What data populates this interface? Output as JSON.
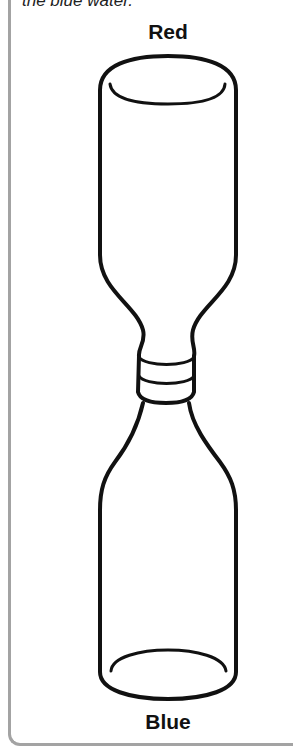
{
  "caption": "the blue water.",
  "labels": {
    "top": "Red",
    "bottom": "Blue"
  },
  "diagram": {
    "top_bottle_label": "Red",
    "bottom_bottle_label": "Blue",
    "stroke_color": "#111111",
    "border_color": "#a3a3a3"
  }
}
